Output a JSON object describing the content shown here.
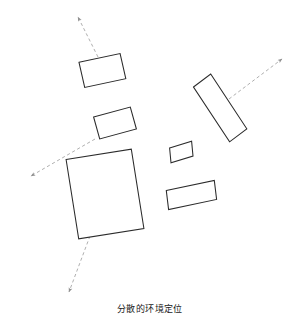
{
  "figure": {
    "caption": "分散的环境定位",
    "background_color": "#ffffff",
    "shape_stroke_color": "#2b2b2b",
    "shape_fill_color": "#ffffff",
    "arrow_color": "#9a9a9a",
    "width": 300,
    "height": 322
  },
  "chart_data": {
    "type": "diagram",
    "title": "分散的环境定位",
    "xlabel": "",
    "ylabel": "",
    "grid": false,
    "legend": "none",
    "xlim": [
      0,
      300
    ],
    "ylim": [
      0,
      322
    ],
    "shapes": [
      {
        "name": "rect-top-left",
        "kind": "rectangle",
        "center": [
          99,
          70
        ],
        "width": 42,
        "height": 28,
        "rotation_deg": -12,
        "points": "79.0,62.3 120.1,53.6 125.8,78.7 84.7,87.4"
      },
      {
        "name": "rect-mid-left",
        "kind": "rectangle",
        "center": [
          113,
          123
        ],
        "width": 38,
        "height": 26,
        "rotation_deg": -15,
        "points": "93.6,117.0 130.3,107.1 136.4,129.0 99.7,138.9"
      },
      {
        "name": "rect-large-bottom-left",
        "kind": "rectangle",
        "center": [
          101,
          194
        ],
        "width": 66,
        "height": 80,
        "rotation_deg": -9,
        "points": "66.1,159.5 131.3,149.2 143.9,228.5 78.7,238.8"
      },
      {
        "name": "rect-long-diagonal-right",
        "kind": "rectangle",
        "center": [
          220,
          108
        ],
        "width": 22,
        "height": 88,
        "rotation_deg": 37,
        "points": "193.5,87.0 210.7,74.0 246.8,128.8 229.6,141.8"
      },
      {
        "name": "rect-small-square-center",
        "kind": "rectangle",
        "center": [
          181,
          152
        ],
        "width": 23,
        "height": 21,
        "rotation_deg": -17,
        "points": "169.6,148.0 191.6,141.3 193.0,156.0 171.0,162.7"
      },
      {
        "name": "rect-bottom-right",
        "kind": "rectangle",
        "center": [
          191,
          195
        ],
        "width": 49,
        "height": 22,
        "rotation_deg": -12,
        "points": "166.3,190.6 214.3,180.4 216.6,199.4 168.6,209.6"
      }
    ],
    "arrows": [
      {
        "name": "arrow-up-left",
        "from": [
          98,
          57
        ],
        "to": [
          78,
          17
        ],
        "style": "dashed",
        "arrowhead": "to"
      },
      {
        "name": "arrow-down-left",
        "from": [
          95,
          139
        ],
        "to": [
          31,
          176
        ],
        "style": "dashed",
        "arrowhead": "to"
      },
      {
        "name": "arrow-up-right",
        "from": [
          229,
          99
        ],
        "to": [
          282,
          59
        ],
        "style": "dashed",
        "arrowhead": "to"
      },
      {
        "name": "arrow-down-bottom",
        "from": [
          90,
          236
        ],
        "to": [
          69,
          292
        ],
        "style": "dashed",
        "arrowhead": "to"
      }
    ]
  }
}
